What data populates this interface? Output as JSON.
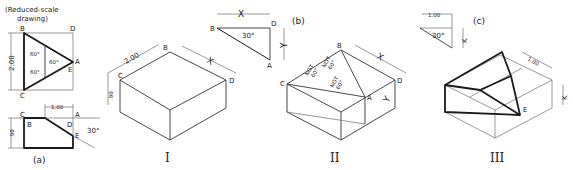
{
  "figure": {
    "caption_note": "(Reduced-scale",
    "caption_note2": "drawing)",
    "part_a": {
      "label": "(a)",
      "top_view": {
        "points": {
          "B": "B",
          "D": "D",
          "C": "C",
          "A": "A",
          "E": "E"
        },
        "dimension": "2.00",
        "angles": [
          "60°",
          "60°",
          "60°"
        ]
      },
      "front_view": {
        "points": {
          "C": "C",
          "B": "B",
          "A": "A",
          "D": "D",
          "E": "E"
        },
        "dim_width": "1.00",
        "dim_height": ".90",
        "angle": "30°"
      }
    },
    "part_b": {
      "label": "(b)",
      "points": {
        "B": "B",
        "D": "D",
        "A": "A"
      },
      "dim_x": "X",
      "dim_y": "Y",
      "angle": "30°"
    },
    "part_c": {
      "label": "(c)",
      "dim_width": "1.00",
      "dim_k": "K",
      "angle": "30°"
    },
    "view_I": {
      "label": "I",
      "points": {
        "B": "B",
        "C": "C",
        "D": "D"
      },
      "dim_length": "2.00",
      "dim_x": "X",
      "dim_height": ".90"
    },
    "view_II": {
      "label": "II",
      "points": {
        "B": "B",
        "C": "C",
        "D": "D",
        "A": "A"
      },
      "dim_x": "X",
      "dim_y": "Y",
      "not_label": "NOT",
      "not_angle": "60°"
    },
    "view_III": {
      "label": "III",
      "points": {
        "E": "E"
      },
      "dim_width": "1.00",
      "dim_k": "K"
    }
  }
}
